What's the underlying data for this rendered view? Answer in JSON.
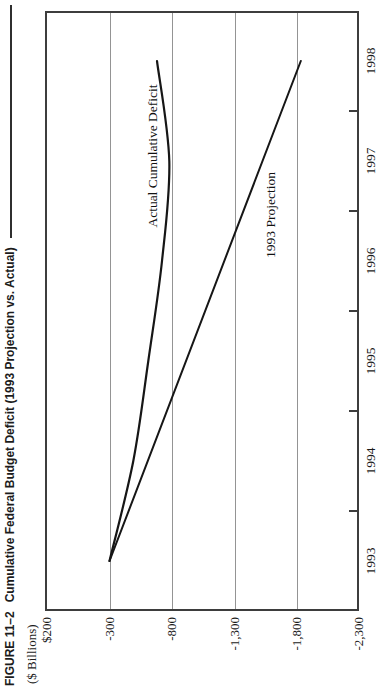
{
  "figure": {
    "label": "FIGURE 11–2",
    "title": "Cumulative Federal Budget Deficit (1993 Projection vs. Actual)",
    "units_label": "($ Billions)"
  },
  "axes": {
    "y_tick_labels": [
      "$200",
      "-300",
      "-800",
      "-1,300",
      "-1,800",
      "-2,300"
    ],
    "x_tick_labels": [
      "1993",
      "1994",
      "1995",
      "1996",
      "1997",
      "1998"
    ]
  },
  "series_labels": {
    "actual": "Actual Cumulative Deficit",
    "projection": "1993 Projection"
  },
  "colors": {
    "ink": "#1c1c1c",
    "line": "#161616",
    "gridline": "#949494",
    "frame": "#3d3d3d",
    "paper": "#ffffff"
  },
  "chart_data": {
    "type": "line",
    "title": "FIGURE 11–2 Cumulative Federal Budget Deficit (1993 Projection vs. Actual)",
    "ylabel": "($ Billions)",
    "x": [
      1993,
      1994,
      1995,
      1996,
      1997,
      1998
    ],
    "series": [
      {
        "name": "Actual Cumulative Deficit",
        "values": [
          -300,
          -490,
          -610,
          -720,
          -778,
          -680
        ],
        "style": "smooth-curve"
      },
      {
        "name": "1993 Projection",
        "values": [
          -300,
          -606,
          -912,
          -1218,
          -1524,
          -1830
        ],
        "style": "straight-line"
      }
    ],
    "ylim": [
      -2300,
      200
    ],
    "ytick_step": 500,
    "grid": "y-gridlines-only",
    "legend_position": "inline-labels-on-plot",
    "orientation_note": "figure printed rotated 90deg counterclockwise on portrait page"
  }
}
